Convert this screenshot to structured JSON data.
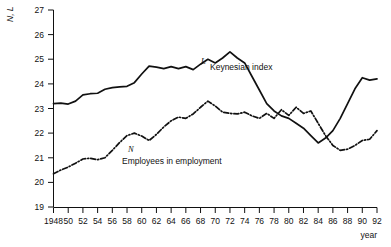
{
  "chart_data": {
    "type": "line",
    "title": "",
    "xlabel": "year",
    "ylabel": "N, L",
    "xlim": [
      1948,
      1992
    ],
    "ylim": [
      19,
      27
    ],
    "grid": false,
    "legend_position": "inline-annotations",
    "ytick_labels": [
      "19",
      "20",
      "21",
      "22",
      "23",
      "24",
      "25",
      "26",
      "27"
    ],
    "ytick_values": [
      19,
      20,
      21,
      22,
      23,
      24,
      25,
      26,
      27
    ],
    "xtick_labels": [
      "1948",
      "50",
      "52",
      "54",
      "56",
      "58",
      "60",
      "62",
      "64",
      "66",
      "68",
      "70",
      "72",
      "74",
      "76",
      "78",
      "80",
      "82",
      "84",
      "86",
      "88",
      "90",
      "92"
    ],
    "xtick_values": [
      1948,
      1950,
      1952,
      1954,
      1956,
      1958,
      1960,
      1962,
      1964,
      1966,
      1968,
      1970,
      1972,
      1974,
      1976,
      1978,
      1980,
      1982,
      1984,
      1986,
      1988,
      1990,
      1992
    ],
    "x": [
      1948,
      1949,
      1950,
      1951,
      1952,
      1953,
      1954,
      1955,
      1956,
      1957,
      1958,
      1959,
      1960,
      1961,
      1962,
      1963,
      1964,
      1965,
      1966,
      1967,
      1968,
      1969,
      1970,
      1971,
      1972,
      1973,
      1974,
      1975,
      1976,
      1977,
      1978,
      1979,
      1980,
      1981,
      1982,
      1983,
      1984,
      1985,
      1986,
      1987,
      1988,
      1989,
      1990,
      1991,
      1992
    ],
    "series": [
      {
        "name": "Keynesian index",
        "symbol": "L",
        "style": "solid",
        "values": [
          23.2,
          23.22,
          23.18,
          23.3,
          23.55,
          23.6,
          23.62,
          23.78,
          23.85,
          23.88,
          23.9,
          24.05,
          24.4,
          24.72,
          24.68,
          24.62,
          24.7,
          24.62,
          24.7,
          24.58,
          24.8,
          25.0,
          24.85,
          25.05,
          25.3,
          25.05,
          24.85,
          24.3,
          23.75,
          23.2,
          22.9,
          22.7,
          22.6,
          22.4,
          22.2,
          21.9,
          21.6,
          21.8,
          22.1,
          22.6,
          23.2,
          23.8,
          24.25,
          24.15,
          24.2
        ]
      },
      {
        "name": "Employees in employment",
        "symbol": "N",
        "style": "dash-dot",
        "values": [
          20.35,
          20.5,
          20.62,
          20.78,
          20.95,
          20.98,
          20.92,
          21.0,
          21.3,
          21.62,
          21.9,
          22.0,
          21.88,
          21.7,
          21.95,
          22.25,
          22.5,
          22.65,
          22.6,
          22.78,
          23.05,
          23.3,
          23.1,
          22.85,
          22.8,
          22.78,
          22.85,
          22.7,
          22.6,
          22.8,
          22.6,
          22.95,
          22.72,
          23.05,
          22.8,
          22.9,
          22.4,
          21.9,
          21.5,
          21.3,
          21.35,
          21.5,
          21.7,
          21.75,
          22.1
        ]
      }
    ],
    "annotations": [
      {
        "symbol": "L",
        "text": "Keynesian index"
      },
      {
        "symbol": "N",
        "text": "Employees in employment"
      }
    ]
  }
}
